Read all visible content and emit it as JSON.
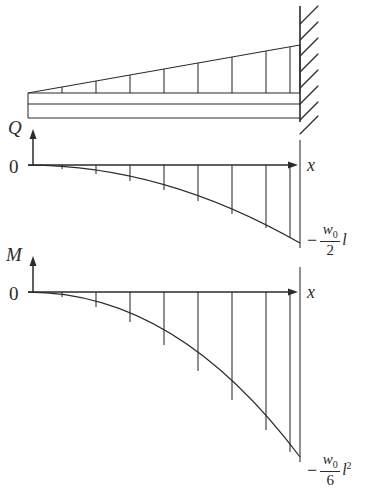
{
  "figure": {
    "background_color": "#ffffff",
    "line_color": "#2b2b2b"
  },
  "beam_diagram": {
    "name": "cantilever-beam-with-triangular-load",
    "support_type": "fixed-wall-right",
    "load_shape": "triangular",
    "load_peak_side": "right",
    "hatch_count": 8,
    "load_tick_count": 8
  },
  "shear_diagram": {
    "axis_label": "Q",
    "origin_label": "0",
    "x_axis_label": "x",
    "curve_type": "quadratic",
    "tick_count": 8,
    "end_value": {
      "minus": "−",
      "numerator": "w",
      "numerator_sub": "0",
      "denominator": "2",
      "tail": "l"
    }
  },
  "moment_diagram": {
    "axis_label": "M",
    "origin_label": "0",
    "x_axis_label": "x",
    "curve_type": "cubic",
    "tick_count": 8,
    "end_value": {
      "minus": "−",
      "numerator": "w",
      "numerator_sub": "0",
      "denominator": "6",
      "tail": "l",
      "tail_sup": "2"
    }
  }
}
